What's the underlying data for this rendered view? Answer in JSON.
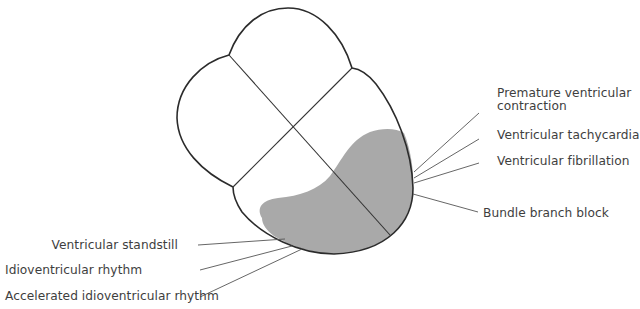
{
  "diagram": {
    "type": "ventricle-lesion-diagram",
    "colors": {
      "outline": "#2b2b2b",
      "divider": "#333333",
      "leader": "#555555",
      "shaded_region": "#a9a9a9",
      "text": "#3e3e3e"
    },
    "labels_right": [
      {
        "id": "pvc",
        "line1": "Premature ventricular",
        "line2": "contraction"
      },
      {
        "id": "vt",
        "line1": "Ventricular tachycardia"
      },
      {
        "id": "vf",
        "line1": "Ventricular fibrillation"
      },
      {
        "id": "bbb",
        "line1": "Bundle branch block"
      }
    ],
    "labels_left": [
      {
        "id": "vs",
        "line1": "Ventricular standstill"
      },
      {
        "id": "ir",
        "line1": "Idioventricular rhythm"
      },
      {
        "id": "air",
        "line1": "Accelerated idioventricular rhythm"
      }
    ]
  }
}
